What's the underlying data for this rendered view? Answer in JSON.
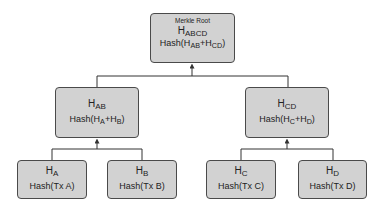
{
  "diagram": {
    "root": {
      "caption": "Merkle Root",
      "label": {
        "base": "H",
        "sub": "ABCD"
      },
      "hash": {
        "prefix": "Hash(H",
        "sub1": "AB",
        "mid": "+H",
        "sub2": "CD",
        "suffix": ")"
      }
    },
    "level1": [
      {
        "id": "ab",
        "label": {
          "base": "H",
          "sub": "AB"
        },
        "hash": {
          "prefix": "Hash(H",
          "sub1": "A",
          "mid": "+H",
          "sub2": "B",
          "suffix": ")"
        }
      },
      {
        "id": "cd",
        "label": {
          "base": "H",
          "sub": "CD"
        },
        "hash": {
          "prefix": "Hash(H",
          "sub1": "C",
          "mid": "+H",
          "sub2": "D",
          "suffix": ")"
        }
      }
    ],
    "leaves": [
      {
        "id": "a",
        "label": {
          "base": "H",
          "sub": "A"
        },
        "hash": "Hash(Tx A)"
      },
      {
        "id": "b",
        "label": {
          "base": "H",
          "sub": "B"
        },
        "hash": "Hash(Tx B)"
      },
      {
        "id": "c",
        "label": {
          "base": "H",
          "sub": "C"
        },
        "hash": "Hash(Tx C)"
      },
      {
        "id": "d",
        "label": {
          "base": "H",
          "sub": "D"
        },
        "hash": "Hash(Tx D)"
      }
    ],
    "colors": {
      "node_fill": "#d2d2d2",
      "node_border": "#4a4a4a",
      "connector": "#333333"
    }
  }
}
